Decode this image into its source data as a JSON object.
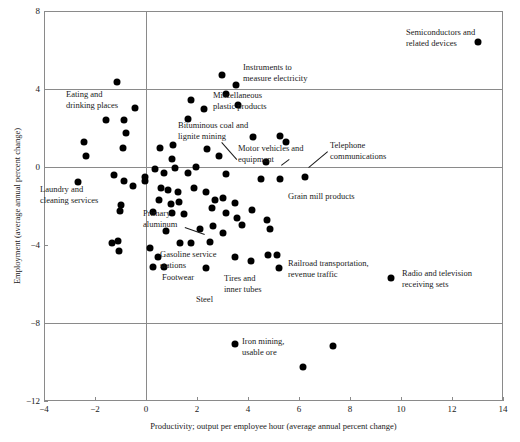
{
  "chart": {
    "type": "scatter",
    "title": "",
    "xlabel": "Productivity; output per employee hour (average annual percent change)",
    "ylabel": "Employment (average annual percent change)",
    "xlim": [
      -4,
      14
    ],
    "ylim": [
      -12,
      8
    ],
    "xticks": [
      "-4",
      "-2",
      "0",
      "2",
      "4",
      "6",
      "8",
      "10",
      "12",
      "14"
    ],
    "xtick_values": [
      -4,
      -2,
      0,
      2,
      4,
      6,
      8,
      10,
      12,
      14
    ],
    "yticks": [
      "8",
      "4",
      "0",
      "-4",
      "-8",
      "-12"
    ],
    "ytick_values": [
      8,
      4,
      0,
      -4,
      -8,
      -12
    ],
    "grid": "reference lines at y=4, y=0, y=-8 and x=0",
    "legend": "none"
  },
  "chart_data": {
    "type": "scatter",
    "title": "",
    "xlabel": "Productivity; output per employee hour (average annual percent change)",
    "ylabel": "Employment (average annual percent change)",
    "xlim": [
      -4,
      14
    ],
    "ylim": [
      -12,
      8
    ],
    "xticks": [
      -4,
      -2,
      0,
      2,
      4,
      6,
      8,
      10,
      12,
      14
    ],
    "yticks": [
      8,
      4,
      0,
      -4,
      -8,
      -12
    ],
    "gridlines_y": [
      4,
      0,
      -8
    ],
    "gridlines_x": [
      0
    ],
    "points": [
      {
        "x": 13.0,
        "y": 6.4,
        "label": "Semiconductors and related devices"
      },
      {
        "x": 2.96,
        "y": 4.72,
        "label": "Instruments to measure electricity"
      },
      {
        "x": 3.54,
        "y": 4.2,
        "label": ""
      },
      {
        "x": -1.15,
        "y": 4.36,
        "label": ""
      },
      {
        "x": 1.75,
        "y": 3.44,
        "label": ""
      },
      {
        "x": 3.15,
        "y": 3.74,
        "label": ""
      },
      {
        "x": 3.62,
        "y": 3.18,
        "label": "Miscellaneous plastic products"
      },
      {
        "x": -0.42,
        "y": 3.03,
        "label": ""
      },
      {
        "x": 2.28,
        "y": 3.0,
        "label": ""
      },
      {
        "x": -1.58,
        "y": 2.4,
        "label": ""
      },
      {
        "x": -0.88,
        "y": 2.4,
        "label": ""
      },
      {
        "x": 1.65,
        "y": 2.48,
        "label": ""
      },
      {
        "x": -0.8,
        "y": 1.74,
        "label": ""
      },
      {
        "x": -2.45,
        "y": 1.3,
        "label": ""
      },
      {
        "x": 4.2,
        "y": 1.55,
        "label": ""
      },
      {
        "x": 5.25,
        "y": 1.6,
        "label": ""
      },
      {
        "x": 5.5,
        "y": 1.3,
        "label": ""
      },
      {
        "x": -0.9,
        "y": 1.0,
        "label": ""
      },
      {
        "x": 0.55,
        "y": 1.0,
        "label": ""
      },
      {
        "x": 1.05,
        "y": 1.15,
        "label": ""
      },
      {
        "x": 2.4,
        "y": 0.95,
        "label": ""
      },
      {
        "x": -2.35,
        "y": 0.55,
        "label": ""
      },
      {
        "x": 1.0,
        "y": 0.42,
        "label": ""
      },
      {
        "x": 2.85,
        "y": 0.55,
        "label": ""
      },
      {
        "x": 4.7,
        "y": 0.25,
        "label": "Bituminous coal and lignite mining"
      },
      {
        "x": 1.95,
        "y": 0.0,
        "label": ""
      },
      {
        "x": 0.35,
        "y": -0.1,
        "label": ""
      },
      {
        "x": -1.25,
        "y": -0.4,
        "label": ""
      },
      {
        "x": -0.85,
        "y": -0.72,
        "label": ""
      },
      {
        "x": -0.5,
        "y": -0.98,
        "label": ""
      },
      {
        "x": -0.04,
        "y": -0.5,
        "label": ""
      },
      {
        "x": 0.7,
        "y": -0.32,
        "label": ""
      },
      {
        "x": 1.65,
        "y": -0.28,
        "label": ""
      },
      {
        "x": 1.15,
        "y": -0.05,
        "label": ""
      },
      {
        "x": 3.15,
        "y": -0.36,
        "label": ""
      },
      {
        "x": 4.5,
        "y": -0.6,
        "label": "Motor vehicles and equipment"
      },
      {
        "x": 5.27,
        "y": -0.62,
        "label": ""
      },
      {
        "x": 6.23,
        "y": -0.5,
        "label": "Telephone communications"
      },
      {
        "x": -0.04,
        "y": -0.72,
        "label": ""
      },
      {
        "x": 0.58,
        "y": -1.08,
        "label": ""
      },
      {
        "x": 0.88,
        "y": -1.2,
        "label": ""
      },
      {
        "x": 1.27,
        "y": -1.28,
        "label": ""
      },
      {
        "x": 1.88,
        "y": -1.08,
        "label": ""
      },
      {
        "x": 2.35,
        "y": -1.28,
        "label": ""
      },
      {
        "x": 2.7,
        "y": -1.7,
        "label": ""
      },
      {
        "x": -2.65,
        "y": -0.75,
        "label": "Laundry and cleaning services"
      },
      {
        "x": -1.0,
        "y": -1.95,
        "label": ""
      },
      {
        "x": -1.04,
        "y": -2.26,
        "label": ""
      },
      {
        "x": 0.5,
        "y": -1.7,
        "label": ""
      },
      {
        "x": 0.96,
        "y": -1.9,
        "label": ""
      },
      {
        "x": 1.3,
        "y": -1.8,
        "label": ""
      },
      {
        "x": 3.0,
        "y": -1.6,
        "label": ""
      },
      {
        "x": 3.5,
        "y": -1.85,
        "label": "Grain mill products"
      },
      {
        "x": 3.55,
        "y": -2.6,
        "label": ""
      },
      {
        "x": 0.27,
        "y": -2.3,
        "label": "Primary aluminum"
      },
      {
        "x": 1.0,
        "y": -2.36,
        "label": ""
      },
      {
        "x": 1.5,
        "y": -2.4,
        "label": ""
      },
      {
        "x": 2.6,
        "y": -2.1,
        "label": ""
      },
      {
        "x": 3.15,
        "y": -2.35,
        "label": ""
      },
      {
        "x": 4.15,
        "y": -2.2,
        "label": ""
      },
      {
        "x": 4.73,
        "y": -2.72,
        "label": ""
      },
      {
        "x": 0.77,
        "y": -3.28,
        "label": ""
      },
      {
        "x": 2.1,
        "y": -3.2,
        "label": ""
      },
      {
        "x": 2.62,
        "y": -3.0,
        "label": ""
      },
      {
        "x": 3.0,
        "y": -3.4,
        "label": ""
      },
      {
        "x": 3.77,
        "y": -2.95,
        "label": ""
      },
      {
        "x": 4.85,
        "y": -3.18,
        "label": ""
      },
      {
        "x": 1.35,
        "y": -3.9,
        "label": ""
      },
      {
        "x": 1.77,
        "y": -3.9,
        "label": ""
      },
      {
        "x": 2.5,
        "y": -3.85,
        "label": ""
      },
      {
        "x": 0.15,
        "y": -4.15,
        "label": ""
      },
      {
        "x": -1.35,
        "y": -3.9,
        "label": ""
      },
      {
        "x": -1.1,
        "y": -3.8,
        "label": ""
      },
      {
        "x": -1.05,
        "y": -4.3,
        "label": ""
      },
      {
        "x": 0.46,
        "y": -4.6,
        "label": "Gasoline service stations"
      },
      {
        "x": 0.27,
        "y": -5.13,
        "label": ""
      },
      {
        "x": 0.7,
        "y": -5.13,
        "label": ""
      },
      {
        "x": 2.35,
        "y": -5.2,
        "label": "Steel"
      },
      {
        "x": 3.5,
        "y": -4.6,
        "label": "Tires and inner tubes"
      },
      {
        "x": 4.12,
        "y": -4.8,
        "label": ""
      },
      {
        "x": 4.8,
        "y": -4.5,
        "label": ""
      },
      {
        "x": 5.15,
        "y": -4.5,
        "label": ""
      },
      {
        "x": 5.23,
        "y": -5.18,
        "label": "Railroad transportation, revenue traffic"
      },
      {
        "x": 9.62,
        "y": -5.7,
        "label": "Radio and television receiving sets"
      },
      {
        "x": 3.5,
        "y": -9.08,
        "label": "Iron mining, usable ore"
      },
      {
        "x": 7.35,
        "y": -9.2,
        "label": ""
      },
      {
        "x": 6.15,
        "y": -10.26,
        "label": ""
      }
    ],
    "annotations": [
      {
        "text": "Semiconductors and\nrelated devices",
        "x": 13.0,
        "y": 6.4
      },
      {
        "text": "Instruments to\nmeasure electricity",
        "x": 2.96,
        "y": 4.72
      },
      {
        "text": "Eating and\ndrinking places",
        "x": -1.6,
        "y": 3.0
      },
      {
        "text": "Miscellaneous\nplastic products",
        "x": 3.62,
        "y": 3.18
      },
      {
        "text": "Bituminous coal and\nlignite mining",
        "x": 4.7,
        "y": 0.25
      },
      {
        "text": "Motor vehicles and\nequipment",
        "x": 4.5,
        "y": -0.6
      },
      {
        "text": "Telephone\ncommunications",
        "x": 6.23,
        "y": -0.5
      },
      {
        "text": "Grain mill products",
        "x": 3.5,
        "y": -1.85
      },
      {
        "text": "Laundry and\ncleaning services",
        "x": -2.65,
        "y": -1.6
      },
      {
        "text": "Primary\naluminum",
        "x": 0.27,
        "y": -2.3
      },
      {
        "text": "Gasoline service\nstations",
        "x": 0.46,
        "y": -4.6
      },
      {
        "text": "Footwear",
        "x": 0.7,
        "y": -5.13
      },
      {
        "text": "Steel",
        "x": 2.35,
        "y": -5.2
      },
      {
        "text": "Tires and\ninner tubes",
        "x": 3.5,
        "y": -4.6
      },
      {
        "text": "Railroad transportation,\nrevenue traffic",
        "x": 5.23,
        "y": -5.18
      },
      {
        "text": "Radio and television\nreceiving sets",
        "x": 9.62,
        "y": -5.7
      },
      {
        "text": "Iron mining,\nusable ore",
        "x": 3.5,
        "y": -9.08
      }
    ]
  },
  "labels": {
    "semiconductors": "Semiconductors and\nrelated devices",
    "instruments": "Instruments to\nmeasure electricity",
    "eating": "Eating and\ndrinking places",
    "plastics": "Miscellaneous\nplastic products",
    "bituminous": "Bituminous coal and\nlignite mining",
    "motorvehicles": "Motor vehicles and\nequipment",
    "telephone": "Telephone\ncommunications",
    "grainmill": "Grain mill products",
    "laundry": "Laundry and\ncleaning services",
    "primaryalum": "Primary\naluminum",
    "gasoline": "Gasoline service\nstations",
    "footwear": "Footwear",
    "steel": "Steel",
    "tires": "Tires and\ninner tubes",
    "railroad": "Railroad transportation,\nrevenue traffic",
    "radiotv": "Radio and television\nreceiving sets",
    "ironmining": "Iron mining,\nusable ore"
  },
  "colors": {
    "point": "#000000",
    "axis": "#8a8a8a",
    "text": "#1a1a1a",
    "background": "#ffffff"
  }
}
